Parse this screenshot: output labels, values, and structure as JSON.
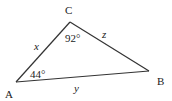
{
  "diagram": {
    "type": "triangle",
    "vertices": {
      "A": {
        "label": "A",
        "x": 16,
        "y": 82
      },
      "B": {
        "label": "B",
        "x": 149,
        "y": 71
      },
      "C": {
        "label": "C",
        "x": 70,
        "y": 22
      }
    },
    "sides": {
      "AC": {
        "label": "x"
      },
      "CB": {
        "label": "z"
      },
      "AB": {
        "label": "y"
      }
    },
    "angles": {
      "C": {
        "label": "92°"
      },
      "A": {
        "label": "44°"
      }
    },
    "line_color": "#333333"
  }
}
